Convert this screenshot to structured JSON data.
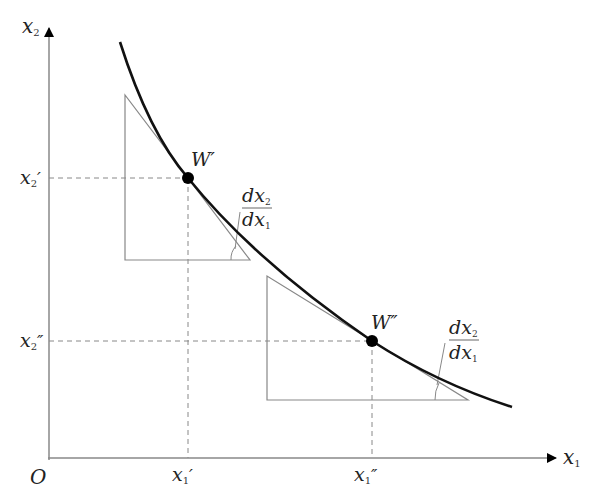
{
  "diagram": {
    "type": "indifference-curve",
    "axes": {
      "origin_label": "O",
      "x_axis": {
        "base": "x",
        "sub": "1"
      },
      "y_axis": {
        "base": "x",
        "sub": "2"
      }
    },
    "points": [
      {
        "name": "W′",
        "label": "W′",
        "x_tick": {
          "base": "x",
          "sub": "1",
          "prime": "′"
        },
        "y_tick": {
          "base": "x",
          "sub": "2",
          "prime": "′"
        }
      },
      {
        "name": "W″",
        "label": "W″",
        "x_tick": {
          "base": "x",
          "sub": "1",
          "prime": "″"
        },
        "y_tick": {
          "base": "x",
          "sub": "2",
          "prime": "″"
        }
      }
    ],
    "slope_labels": [
      {
        "num": "dx",
        "num_sub": "2",
        "den": "dx",
        "den_sub": "1"
      },
      {
        "num": "dx",
        "num_sub": "2",
        "den": "dx",
        "den_sub": "1"
      }
    ]
  },
  "colors": {
    "curve": "#111111",
    "axis": "#888888",
    "triangle": "#888888",
    "dashed": "#888888",
    "point": "#000000"
  }
}
